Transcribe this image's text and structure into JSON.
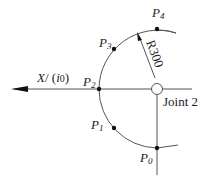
{
  "diagram": {
    "axis_label": "X / (i0)",
    "axis_label_parts": {
      "x": "X",
      "slash": "/ (",
      "i": "i",
      "zero": "0",
      "close": ")"
    },
    "joint_label": "Joint 2",
    "radius_label": "R300",
    "points": [
      {
        "name": "P",
        "sub": "0"
      },
      {
        "name": "P",
        "sub": "1"
      },
      {
        "name": "P",
        "sub": "2"
      },
      {
        "name": "P",
        "sub": "3"
      },
      {
        "name": "P",
        "sub": "4"
      }
    ],
    "colors": {
      "line": "#555555",
      "point": "#111111",
      "text": "#222222"
    }
  }
}
